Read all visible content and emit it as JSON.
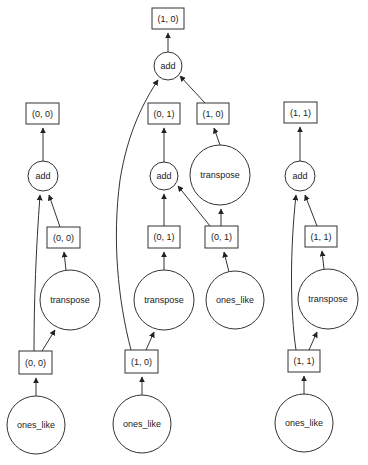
{
  "diagram": {
    "type": "dask-task-graph",
    "colors": {
      "stroke": "#333333",
      "background": "#ffffff",
      "text": "#222222"
    },
    "nodes": [
      {
        "id": "out_10",
        "kind": "key",
        "label": "(1, 0)",
        "x": 152,
        "y": 8,
        "w": 32,
        "h": 21
      },
      {
        "id": "add_10",
        "kind": "task",
        "label": "add",
        "cx": 168,
        "cy": 66,
        "r": 14
      },
      {
        "id": "out_00",
        "kind": "key",
        "label": "(0, 0)",
        "x": 26,
        "y": 103,
        "w": 33,
        "h": 21
      },
      {
        "id": "out_01",
        "kind": "key",
        "label": "(0, 1)",
        "x": 148,
        "y": 103,
        "w": 32,
        "h": 21
      },
      {
        "id": "tr_10",
        "kind": "key",
        "label": "(1, 0)",
        "x": 197,
        "y": 103,
        "w": 32,
        "h": 21
      },
      {
        "id": "out_11",
        "kind": "key",
        "label": "(1, 1)",
        "x": 284,
        "y": 102,
        "w": 33,
        "h": 21
      },
      {
        "id": "add_00",
        "kind": "task",
        "label": "add",
        "cx": 43,
        "cy": 176,
        "r": 15
      },
      {
        "id": "add_01",
        "kind": "task",
        "label": "add",
        "cx": 164,
        "cy": 176,
        "r": 14
      },
      {
        "id": "transpose_10",
        "kind": "task",
        "label": "transpose",
        "cx": 220,
        "cy": 175,
        "r": 30
      },
      {
        "id": "add_11",
        "kind": "task",
        "label": "add",
        "cx": 300,
        "cy": 176,
        "r": 15
      },
      {
        "id": "tr_00",
        "kind": "key",
        "label": "(0, 0)",
        "x": 47,
        "y": 227,
        "w": 33,
        "h": 21
      },
      {
        "id": "tr_01",
        "kind": "key",
        "label": "(0, 1)",
        "x": 148,
        "y": 226,
        "w": 32,
        "h": 22
      },
      {
        "id": "ones_01",
        "kind": "key",
        "label": "(0, 1)",
        "x": 205,
        "y": 226,
        "w": 33,
        "h": 22
      },
      {
        "id": "tr_11",
        "kind": "key",
        "label": "(1, 1)",
        "x": 305,
        "y": 226,
        "w": 32,
        "h": 21
      },
      {
        "id": "transpose_00",
        "kind": "task",
        "label": "transpose",
        "cx": 70,
        "cy": 300,
        "r": 30
      },
      {
        "id": "transpose_01",
        "kind": "task",
        "label": "transpose",
        "cx": 164,
        "cy": 300,
        "r": 30
      },
      {
        "id": "ones_like_01",
        "kind": "task",
        "label": "ones_like",
        "cx": 235,
        "cy": 300,
        "r": 29
      },
      {
        "id": "transpose_11",
        "kind": "task",
        "label": "transpose",
        "cx": 328,
        "cy": 299,
        "r": 30
      },
      {
        "id": "ones_00",
        "kind": "key",
        "label": "(0, 0)",
        "x": 19,
        "y": 351,
        "w": 33,
        "h": 23
      },
      {
        "id": "ones_10",
        "kind": "key",
        "label": "(1, 0)",
        "x": 125,
        "y": 350,
        "w": 33,
        "h": 23
      },
      {
        "id": "ones_11",
        "kind": "key",
        "label": "(1, 1)",
        "x": 288,
        "y": 350,
        "w": 32,
        "h": 22
      },
      {
        "id": "ones_like_00",
        "kind": "task",
        "label": "ones_like",
        "cx": 36,
        "cy": 425,
        "r": 29
      },
      {
        "id": "ones_like_10",
        "kind": "task",
        "label": "ones_like",
        "cx": 142,
        "cy": 424,
        "r": 29
      },
      {
        "id": "ones_like_11",
        "kind": "task",
        "label": "ones_like",
        "cx": 304,
        "cy": 423,
        "r": 29
      }
    ],
    "edges": [
      {
        "from": "add_10",
        "to": "out_10",
        "d": "M168 52 L168 33"
      },
      {
        "from": "ones_10",
        "to": "add_10",
        "d": "M131 350 C118 300 112 240 120 180 C128 130 145 100 158 80"
      },
      {
        "from": "tr_10",
        "to": "add_10",
        "d": "M205 103 L180 76"
      },
      {
        "from": "add_00",
        "to": "out_00",
        "d": "M43 161 L43 128"
      },
      {
        "from": "ones_00",
        "to": "add_00",
        "d": "M34 351 C34 300 36 250 40 195"
      },
      {
        "from": "tr_00",
        "to": "add_00",
        "d": "M60 227 L49 195"
      },
      {
        "from": "add_01",
        "to": "out_01",
        "d": "M164 162 L164 128"
      },
      {
        "from": "tr_01",
        "to": "add_01",
        "d": "M164 226 L164 194"
      },
      {
        "from": "ones_01",
        "to": "add_01",
        "d": "M210 226 L178 186"
      },
      {
        "from": "transpose_10",
        "to": "tr_10",
        "d": "M220 145 L214 128"
      },
      {
        "from": "add_11",
        "to": "out_11",
        "d": "M300 161 L300 127"
      },
      {
        "from": "ones_11",
        "to": "add_11",
        "d": "M296 350 C290 310 290 250 296 195"
      },
      {
        "from": "tr_11",
        "to": "add_11",
        "d": "M317 226 L305 195"
      },
      {
        "from": "transpose_00",
        "to": "tr_00",
        "d": "M66 270 L64 252"
      },
      {
        "from": "ones_00",
        "to": "transpose_00",
        "d": "M42 351 L55 330"
      },
      {
        "from": "transpose_01",
        "to": "tr_01",
        "d": "M164 270 L164 252"
      },
      {
        "from": "ones_10",
        "to": "transpose_01",
        "d": "M146 350 L154 332"
      },
      {
        "from": "ones_like_01",
        "to": "ones_01",
        "d": "M229 272 L224 252"
      },
      {
        "from": "ones_01",
        "to": "transpose_10",
        "d": "M221 226 L221 209"
      },
      {
        "from": "transpose_11",
        "to": "tr_11",
        "d": "M324 269 L322 251"
      },
      {
        "from": "ones_11",
        "to": "transpose_11",
        "d": "M309 350 L317 332"
      },
      {
        "from": "ones_like_00",
        "to": "ones_00",
        "d": "M36 396 L36 378"
      },
      {
        "from": "ones_like_10",
        "to": "ones_10",
        "d": "M142 395 L142 377"
      },
      {
        "from": "ones_like_11",
        "to": "ones_11",
        "d": "M304 394 L304 376"
      }
    ]
  }
}
